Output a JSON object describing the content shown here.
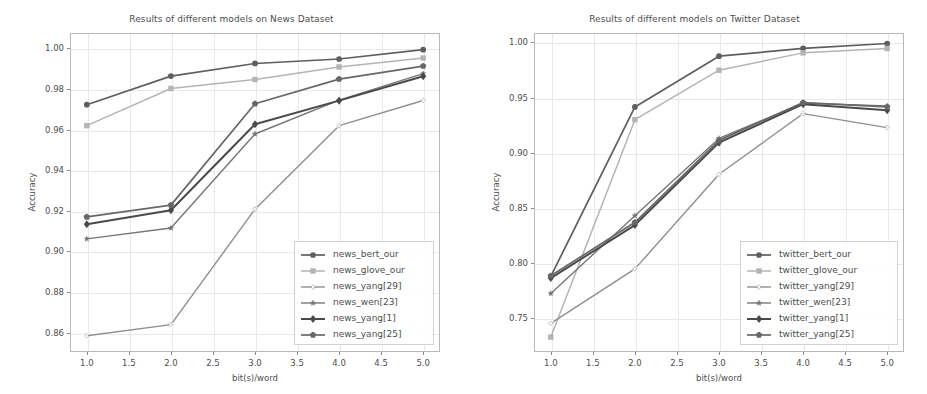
{
  "figure": {
    "width": 927,
    "height": 394,
    "background": "#ffffff",
    "text_color": "#4d4d4d",
    "grid_color": "#e9e9e9",
    "frame_color": "#b8b8b8"
  },
  "chart_data": [
    {
      "type": "line",
      "panel": "left",
      "title": "Results of different models on News Dataset",
      "xlabel": "bit(s)/word",
      "ylabel": "Accuracy",
      "x": [
        1.0,
        2.0,
        3.0,
        4.0,
        5.0
      ],
      "xlim": [
        0.8,
        5.2
      ],
      "ylim": [
        0.8505,
        1.0075
      ],
      "xticks": [
        1.0,
        1.5,
        2.0,
        2.5,
        3.0,
        3.5,
        4.0,
        4.5,
        5.0
      ],
      "xticklabels": [
        "1.0",
        "1.5",
        "2.0",
        "2.5",
        "3.0",
        "3.5",
        "4.0",
        "4.5",
        "5.0"
      ],
      "yticks": [
        0.86,
        0.88,
        0.9,
        0.92,
        0.94,
        0.96,
        0.98,
        1.0
      ],
      "yticklabels": [
        "0.86",
        "0.88",
        "0.90",
        "0.92",
        "0.94",
        "0.96",
        "0.98",
        "1.00"
      ],
      "grid": true,
      "legend_position": "lower right",
      "series": [
        {
          "name": "news_bert_our",
          "values": [
            0.9722,
            0.9863,
            0.9925,
            0.9947,
            0.9993
          ],
          "color": "#5e5e5e",
          "marker": "circle",
          "marker_size": 5.2,
          "line_width": 1.7
        },
        {
          "name": "news_glove_our",
          "values": [
            0.9619,
            0.9802,
            0.9846,
            0.9908,
            0.9952
          ],
          "color": "#b4b4b4",
          "marker": "square",
          "marker_size": 5.2,
          "line_width": 1.5
        },
        {
          "name": "news_yang[29]",
          "values": [
            0.8585,
            0.864,
            0.9208,
            0.9619,
            0.9743
          ],
          "color": "#8f8f8f",
          "marker": "x-square",
          "marker_size": 4.6,
          "line_width": 1.4
        },
        {
          "name": "news_wen[23]",
          "values": [
            0.9062,
            0.9115,
            0.9578,
            0.9745,
            0.9875
          ],
          "color": "#767676",
          "marker": "star",
          "marker_size": 4.6,
          "line_width": 1.4
        },
        {
          "name": "news_yang[1]",
          "values": [
            0.9134,
            0.9203,
            0.9626,
            0.9742,
            0.9862
          ],
          "color": "#4a4a4a",
          "marker": "diamond",
          "marker_size": 5.6,
          "line_width": 2.0
        },
        {
          "name": "news_yang[25]",
          "values": [
            0.917,
            0.9228,
            0.9727,
            0.9848,
            0.9912
          ],
          "color": "#676767",
          "marker": "pentagon",
          "marker_size": 5.0,
          "line_width": 1.7
        }
      ]
    },
    {
      "type": "line",
      "panel": "right",
      "title": "Results of different models on Twitter Dataset",
      "xlabel": "bit(s)/word",
      "ylabel": "Accuracy",
      "x": [
        1.0,
        2.0,
        3.0,
        4.0,
        5.0
      ],
      "xlim": [
        0.8,
        5.2
      ],
      "ylim": [
        0.7195,
        1.0085
      ],
      "xticks": [
        1.0,
        1.5,
        2.0,
        2.5,
        3.0,
        3.5,
        4.0,
        4.5,
        5.0
      ],
      "xticklabels": [
        "1.0",
        "1.5",
        "2.0",
        "2.5",
        "3.0",
        "3.5",
        "4.0",
        "4.5",
        "5.0"
      ],
      "yticks": [
        0.75,
        0.8,
        0.85,
        0.9,
        0.95,
        1.0
      ],
      "yticklabels": [
        "0.75",
        "0.80",
        "0.85",
        "0.90",
        "0.95",
        "1.00"
      ],
      "grid": true,
      "legend_position": "lower right",
      "series": [
        {
          "name": "twitter_bert_our",
          "values": [
            0.788,
            0.9415,
            0.9875,
            0.9945,
            0.999
          ],
          "color": "#5e5e5e",
          "marker": "circle",
          "marker_size": 5.2,
          "line_width": 1.7
        },
        {
          "name": "twitter_glove_our",
          "values": [
            0.733,
            0.93,
            0.9748,
            0.9905,
            0.9945
          ],
          "color": "#b4b4b4",
          "marker": "square",
          "marker_size": 5.2,
          "line_width": 1.5
        },
        {
          "name": "twitter_yang[29]",
          "values": [
            0.7455,
            0.7948,
            0.8805,
            0.9355,
            0.9228
          ],
          "color": "#8f8f8f",
          "marker": "x-square",
          "marker_size": 4.6,
          "line_width": 1.4
        },
        {
          "name": "twitter_wen[23]",
          "values": [
            0.7725,
            0.843,
            0.913,
            0.9448,
            0.9425
          ],
          "color": "#767676",
          "marker": "star",
          "marker_size": 4.6,
          "line_width": 1.4
        },
        {
          "name": "twitter_yang[1]",
          "values": [
            0.7865,
            0.8345,
            0.9092,
            0.944,
            0.9385
          ],
          "color": "#4a4a4a",
          "marker": "diamond",
          "marker_size": 5.6,
          "line_width": 2.0
        },
        {
          "name": "twitter_yang[25]",
          "values": [
            0.7885,
            0.837,
            0.9112,
            0.9455,
            0.9415
          ],
          "color": "#676767",
          "marker": "pentagon",
          "marker_size": 5.0,
          "line_width": 1.7
        }
      ]
    }
  ]
}
